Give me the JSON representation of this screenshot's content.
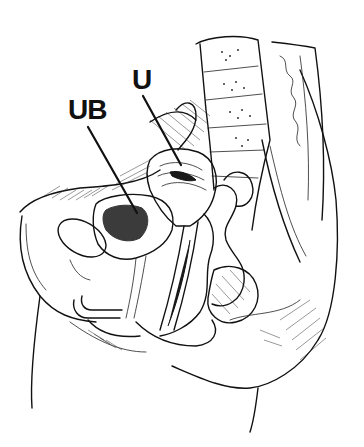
{
  "figure": {
    "type": "anatomical-illustration",
    "view": "sagittal section of female pelvis",
    "style": "black-and-white line drawing",
    "labels": [
      {
        "id": "uterus",
        "text": "U",
        "pointer": {
          "from": [
            143,
            96
          ],
          "to": [
            181,
            165
          ]
        }
      },
      {
        "id": "urinary-bladder",
        "text": "UB",
        "pointer": {
          "from": [
            88,
            127
          ],
          "to": [
            137,
            213
          ]
        }
      }
    ]
  },
  "colors": {
    "background": "#ffffff",
    "ink": "#111111"
  }
}
